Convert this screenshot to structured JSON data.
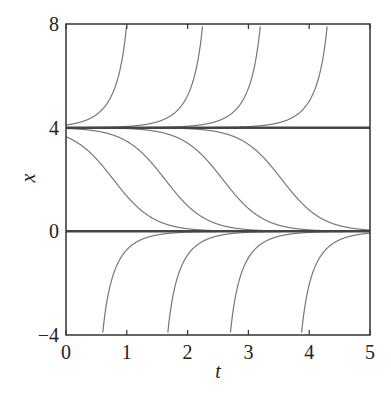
{
  "chart_data": {
    "type": "line",
    "title": "",
    "xlabel": "t",
    "ylabel": "x",
    "xlim": [
      0,
      5
    ],
    "ylim": [
      -4,
      8
    ],
    "xticks": [
      "0",
      "1",
      "2",
      "3",
      "4",
      "5"
    ],
    "yticks": [
      "-4",
      "0",
      "4",
      "8"
    ],
    "grid": false,
    "legend": null,
    "equilibria": [
      0,
      4
    ],
    "model": "x(t) = 4 / (1 - s*exp(3*(t - c)))",
    "series": [
      {
        "name": "above-4 blowup 1",
        "kind": "above",
        "c": 1.23
      },
      {
        "name": "above-4 blowup 2",
        "kind": "above",
        "c": 2.48
      },
      {
        "name": "above-4 blowup 3",
        "kind": "above",
        "c": 3.43
      },
      {
        "name": "above-4 blowup 4",
        "kind": "above",
        "c": 4.53
      },
      {
        "name": "between 4 and 0 #1",
        "kind": "middle",
        "c": 0.78
      },
      {
        "name": "between 4 and 0 #2",
        "kind": "middle",
        "c": 1.63
      },
      {
        "name": "between 4 and 0 #3",
        "kind": "middle",
        "c": 2.58
      },
      {
        "name": "between 4 and 0 #4",
        "kind": "middle",
        "c": 3.55
      },
      {
        "name": "below-0 approach 1",
        "kind": "below",
        "c": 0.37
      },
      {
        "name": "below-0 approach 2",
        "kind": "below",
        "c": 1.44
      },
      {
        "name": "below-0 approach 3",
        "kind": "below",
        "c": 2.47
      },
      {
        "name": "below-0 approach 4",
        "kind": "below",
        "c": 3.64
      },
      {
        "name": "equilibrium x=4",
        "kind": "const",
        "value": 4
      },
      {
        "name": "equilibrium x=0",
        "kind": "const",
        "value": 0
      }
    ]
  },
  "colors": {
    "curve": "#777777",
    "axis": "#333333",
    "equilibrium": "#444444"
  }
}
